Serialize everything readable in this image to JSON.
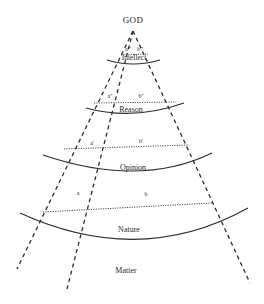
{
  "diagram": {
    "title": "GOD",
    "levels": [
      {
        "name": "Intellect",
        "sublabels": {
          "a": "a'''",
          "b": "b'''"
        }
      },
      {
        "name": "Reason",
        "sublabels": {
          "a": "a''",
          "b": "b''"
        }
      },
      {
        "name": "Opinion",
        "sublabels": {
          "a": "a'",
          "b": "b'"
        }
      },
      {
        "name": "Nature",
        "sublabels": {
          "a": "a",
          "b": "b"
        }
      }
    ],
    "base": "Matter",
    "colors": {
      "line": "#2e2e2e",
      "text": "#2a2a2a",
      "background": "#ffffff"
    }
  }
}
